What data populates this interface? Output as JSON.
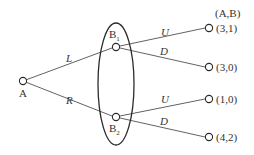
{
  "diagram": {
    "type": "game-tree",
    "payoff_header": "(A,B)",
    "root": {
      "label": "A"
    },
    "info_set": {
      "nodes": [
        {
          "label": "B",
          "subscript": "1"
        },
        {
          "label": "B",
          "subscript": "2"
        }
      ]
    },
    "edges": {
      "root_to_b1": "L",
      "root_to_b2": "R",
      "b1_up": "U",
      "b1_down": "D",
      "b2_up": "U",
      "b2_down": "D"
    },
    "payoffs": [
      "(3,1)",
      "(3,0)",
      "(1,0)",
      "(4,2)"
    ]
  }
}
